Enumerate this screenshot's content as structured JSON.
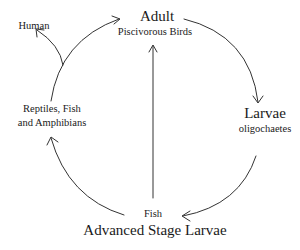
{
  "diagram": {
    "type": "life-cycle",
    "nodes": {
      "adult": {
        "title": "Adult",
        "subtitle": "Piscivorous Birds"
      },
      "larvae": {
        "title": "Larvae",
        "subtitle": "oligochaetes"
      },
      "advanced": {
        "subtitle": "Fish",
        "title": "Advanced Stage Larvae"
      },
      "paratenic": {
        "line1": "Reptiles, Fish",
        "line2": "and Amphibians"
      },
      "human": {
        "label": "Human"
      }
    },
    "edges": [
      {
        "from": "Adult",
        "to": "Larvae"
      },
      {
        "from": "Larvae",
        "to": "Advanced Stage Larvae"
      },
      {
        "from": "Advanced Stage Larvae",
        "to": "Adult"
      },
      {
        "from": "Advanced Stage Larvae",
        "to": "Reptiles, Fish and Amphibians"
      },
      {
        "from": "Reptiles, Fish and Amphibians",
        "to": "Adult"
      },
      {
        "from": "Reptiles, Fish and Amphibians",
        "to": "Human"
      }
    ],
    "colors": {
      "line": "#333333",
      "text": "#1a1a1a",
      "background": "#ffffff"
    }
  }
}
